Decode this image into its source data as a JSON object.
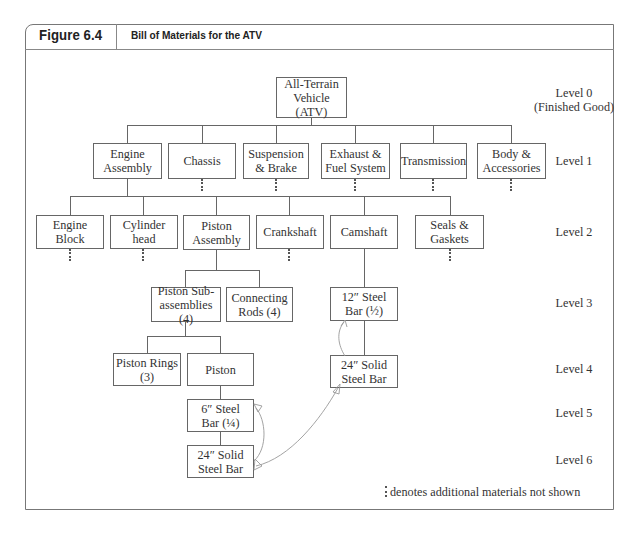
{
  "figure": {
    "number": "Figure 6.4",
    "title": "Bill of Materials for the ATV"
  },
  "levels": [
    {
      "id": "level-0",
      "label": "Level 0\n(Finished Good)"
    },
    {
      "id": "level-1",
      "label": "Level 1"
    },
    {
      "id": "level-2",
      "label": "Level 2"
    },
    {
      "id": "level-3",
      "label": "Level 3"
    },
    {
      "id": "level-4",
      "label": "Level 4"
    },
    {
      "id": "level-5",
      "label": "Level 5"
    },
    {
      "id": "level-6",
      "label": "Level 6"
    }
  ],
  "nodes": {
    "atv": "All-Terrain\nVehicle (ATV)",
    "engine_assembly": "Engine\nAssembly",
    "chassis": "Chassis",
    "suspension": "Suspension\n& Brake",
    "exhaust": "Exhaust &\nFuel System",
    "transmission": "Transmission",
    "body": "Body &\nAccessories",
    "engine_block": "Engine\nBlock",
    "cylinder_head": "Cylinder\nhead",
    "piston_assembly": "Piston\nAssembly",
    "crankshaft": "Crankshaft",
    "camshaft": "Camshaft",
    "seals": "Seals &\nGaskets",
    "piston_subassemblies": "Piston Sub-\nassemblies (4)",
    "connecting_rods": "Connecting\nRods (4)",
    "steel_bar_12": "12″ Steel\nBar (½)",
    "piston_rings": "Piston Rings\n(3)",
    "piston": "Piston",
    "solid_bar_24_cam": "24″ Solid\nSteel Bar",
    "steel_bar_6": "6″ Steel\nBar (¼)",
    "solid_bar_24_piston": "24″ Solid\nSteel Bar"
  },
  "legend": {
    "text": "denotes additional materials not shown"
  },
  "colors": {
    "line": "#666666",
    "text": "#333333",
    "annotation": "#999999"
  }
}
